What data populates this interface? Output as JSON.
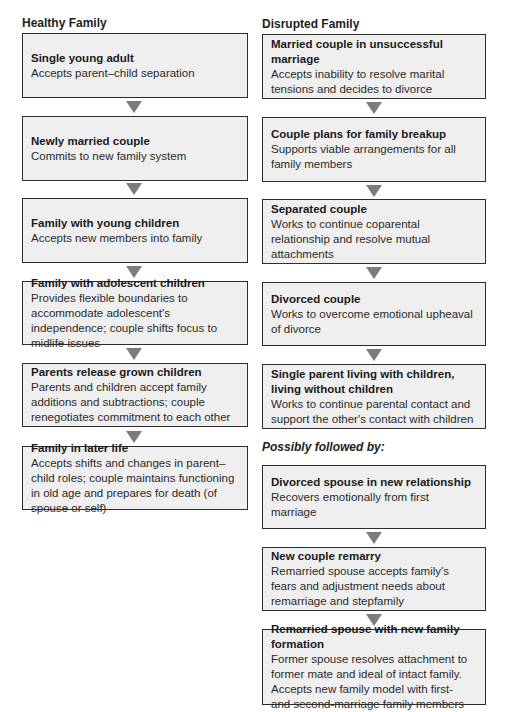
{
  "healthy": {
    "heading": "Healthy Family",
    "stages": [
      {
        "title": "Single young adult",
        "desc": "Accepts parent–child separation"
      },
      {
        "title": "Newly married couple",
        "desc": "Commits to new family system"
      },
      {
        "title": "Family with young children",
        "desc": "Accepts new members into family"
      },
      {
        "title": "Family with adolescent children",
        "desc": "Provides flexible boundaries to accommodate adolescent's independence; couple shifts focus to midlife issues"
      },
      {
        "title": "Parents release grown children",
        "desc": "Parents and children accept family additions and subtractions; couple renegotiates commitment to each other"
      },
      {
        "title": "Family in later life",
        "desc": "Accepts shifts and changes in parent–child roles; couple maintains functioning in old age and prepares for death (of spouse or self)"
      }
    ]
  },
  "disrupted": {
    "heading": "Disrupted Family",
    "stages": [
      {
        "title": "Married couple in unsuccessful marriage",
        "desc": "Accepts inability to resolve marital tensions and decides to divorce"
      },
      {
        "title": "Couple plans for family breakup",
        "desc": "Supports viable arrangements for all family members"
      },
      {
        "title": "Separated couple",
        "desc": "Works to continue coparental relationship and resolve mutual attachments"
      },
      {
        "title": "Divorced couple",
        "desc": "Works to overcome emotional upheaval of divorce"
      },
      {
        "title": "Single parent living with children, living without children",
        "desc": "Works to continue parental contact and support the other's contact with children"
      }
    ],
    "followed_label": "Possibly followed by:",
    "followup_stages": [
      {
        "title": "Divorced spouse in new relationship",
        "desc": "Recovers emotionally from first marriage"
      },
      {
        "title": "New couple remarry",
        "desc": "Remarried spouse accepts family's fears and adjustment needs about remarriage and stepfamily"
      },
      {
        "title": "Remarried spouse with new family formation",
        "desc": "Former spouse resolves attachment to former mate and ideal of intact family. Accepts new family model with first- and second-marriage family members"
      }
    ]
  },
  "colors": {
    "box_fill": "#efefef",
    "box_border": "#2d2d2d",
    "arrow": "#7c7c7c"
  }
}
